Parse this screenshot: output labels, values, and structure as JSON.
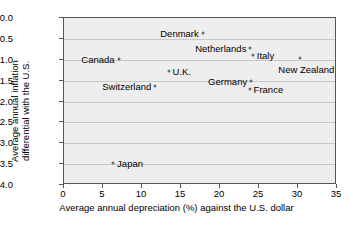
{
  "chart_data": {
    "type": "scatter",
    "title": "",
    "xlabel": "Average annual depreciation (%) against the U.S. dollar",
    "ylabel_line1": "Average annual inflation",
    "ylabel_line2": "differential with the U.S.",
    "xlim": [
      0,
      35
    ],
    "ylim": [
      -4.0,
      0.0
    ],
    "xticks": [
      "0",
      "5",
      "10",
      "15",
      "20",
      "25",
      "30",
      "35"
    ],
    "xtick_values": [
      0,
      5,
      10,
      15,
      20,
      25,
      30,
      35
    ],
    "yticks": [
      "0.0",
      "−0.5",
      "−1.0",
      "−1.5",
      "−2.0",
      "−2.5",
      "−3.0",
      "−3.5",
      "−4.0"
    ],
    "ytick_values": [
      0.0,
      -0.5,
      -1.0,
      -1.5,
      -2.0,
      -2.5,
      -3.0,
      -3.5,
      -4.0
    ],
    "grid": true,
    "grid_axis": "y",
    "legend": "none",
    "marker_color": "#6e6e6e",
    "plot_background": "#eeeeee",
    "points": [
      {
        "label": "Denmark",
        "x": 17.8,
        "y": -0.36,
        "label_side": "left"
      },
      {
        "label": "Canada",
        "x": 7.0,
        "y": -0.98,
        "label_side": "left"
      },
      {
        "label": "Netherlands",
        "x": 23.9,
        "y": -0.72,
        "label_side": "left"
      },
      {
        "label": "Italy",
        "x": 24.2,
        "y": -0.89,
        "label_side": "right"
      },
      {
        "label": "New Zealand",
        "x": 30.3,
        "y": -0.96,
        "label_side": "below"
      },
      {
        "label": "U.K.",
        "x": 13.4,
        "y": -1.27,
        "label_side": "right"
      },
      {
        "label": "Germany",
        "x": 24.0,
        "y": -1.51,
        "label_side": "left"
      },
      {
        "label": "France",
        "x": 23.8,
        "y": -1.7,
        "label_side": "right"
      },
      {
        "label": "Switzerland",
        "x": 11.7,
        "y": -1.63,
        "label_side": "left"
      },
      {
        "label": "Japan",
        "x": 6.3,
        "y": -3.47,
        "label_side": "right"
      }
    ]
  }
}
